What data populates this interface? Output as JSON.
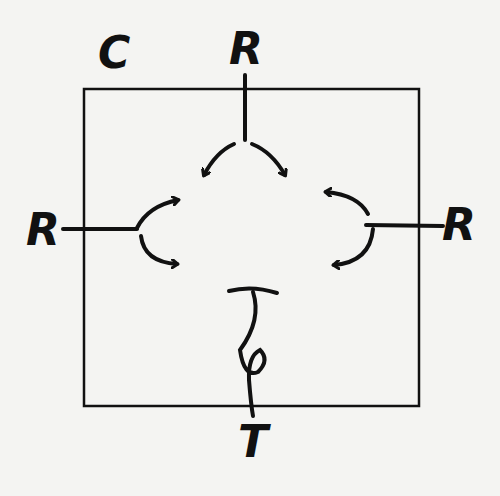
{
  "diagram": {
    "labels": {
      "corner": "C",
      "top": "R",
      "left": "R",
      "right": "R",
      "bottom": "T"
    },
    "elements": {
      "box": "square boundary",
      "top_input": "line from R entering box splitting into two curved arrows",
      "left_input": "line from R entering box splitting into two curved arrows",
      "right_input": "line from R entering box splitting into two curved arrows",
      "bottom_output": "twisted line (loop) exiting box to T"
    },
    "colors": {
      "ink": "#111111",
      "paper": "#f4f4f2"
    }
  }
}
